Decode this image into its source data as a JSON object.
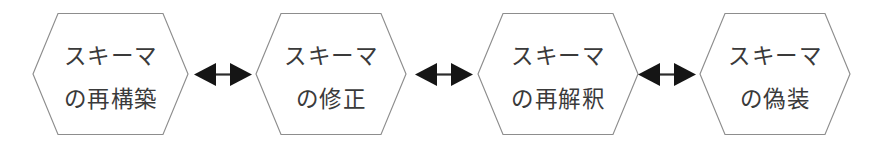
{
  "diagram": {
    "type": "horizontal-flow",
    "orientation": "left-to-right",
    "background_color": "#ffffff",
    "node_shape": "hexagon",
    "node_fill": "#ffffff",
    "node_stroke": "#8d8d8d",
    "text_color": "#3a3a3a",
    "arrow_color": "#151515",
    "node_count": 4,
    "connector_count": 3,
    "nodes": [
      {
        "id": "node-1",
        "name": "schema-reconstruction",
        "line1": "スキーマ",
        "line2": "の再構築",
        "full_text": "スキーマの再構築"
      },
      {
        "id": "node-2",
        "name": "schema-modification",
        "line1": "スキーマ",
        "line2": "の修正",
        "full_text": "スキーマの修正"
      },
      {
        "id": "node-3",
        "name": "schema-reinterpretation",
        "line1": "スキーマ",
        "line2": "の再解釈",
        "full_text": "スキーマの再解釈"
      },
      {
        "id": "node-4",
        "name": "schema-disguise",
        "line1": "スキーマ",
        "line2": "の偽装",
        "full_text": "スキーマの偽装"
      }
    ],
    "connectors": [
      {
        "id": "connector-1",
        "name": "bidirectional-arrow",
        "from": "node-1",
        "to": "node-2",
        "style": "double-headed"
      },
      {
        "id": "connector-2",
        "name": "bidirectional-arrow",
        "from": "node-2",
        "to": "node-3",
        "style": "double-headed"
      },
      {
        "id": "connector-3",
        "name": "bidirectional-arrow",
        "from": "node-3",
        "to": "node-4",
        "style": "double-headed"
      }
    ]
  }
}
